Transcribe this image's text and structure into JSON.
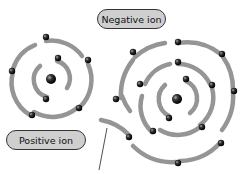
{
  "diagram": {
    "labels": {
      "negative": "Negative ion",
      "positive": "Positive ion"
    },
    "colors": {
      "shell": "#8a8a8a",
      "electron": "#1a1a1a",
      "label_fill": "#cfcfcf",
      "label_border": "#333333"
    },
    "atoms": [
      {
        "name": "positive-ion",
        "nucleus": [
          51,
          79
        ],
        "shells": 3
      },
      {
        "name": "negative-ion",
        "nucleus": [
          177,
          99
        ],
        "shells": 4
      }
    ]
  }
}
